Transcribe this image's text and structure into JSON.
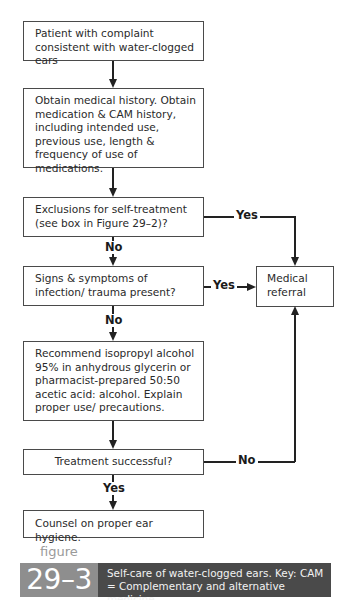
{
  "flowchart": {
    "nodes": {
      "start": "Patient with complaint consistent with water-clogged ears",
      "history": "Obtain medical history. Obtain medication & CAM history, including intended use, previous use, length & frequency of use of medications.",
      "exclusions": "Exclusions for self-treatment (see box in Figure 29–2)?",
      "infection": "Signs & symptoms of infection/ trauma present?",
      "referral": "Medical referral",
      "recommend": "Recommend isopropyl alcohol 95% in anhydrous glycerin or pharmacist-prepared 50:50 acetic acid: alcohol. Explain proper use/ precautions.",
      "success": "Treatment successful?",
      "counsel": "Counsel on proper ear hygiene."
    },
    "edges": {
      "exclusions_yes": "Yes",
      "exclusions_no": "No",
      "infection_yes": "Yes",
      "infection_no": "No",
      "success_no": "No",
      "success_yes": "Yes"
    }
  },
  "caption": {
    "figure_word": "figure",
    "figure_number": "29–3",
    "text": "Self-care of water-clogged ears. Key: CAM = Complementary and alternative medicine."
  }
}
